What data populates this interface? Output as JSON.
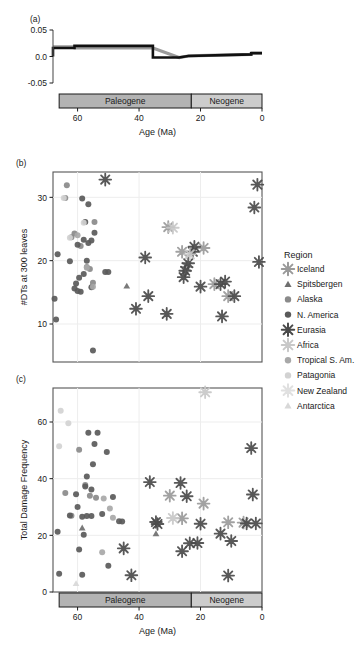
{
  "figure": {
    "panels": [
      "(a)",
      "(b)",
      "(c)"
    ],
    "axis_title_x": "Age (Ma)",
    "eras": [
      {
        "name": "Paleogene",
        "start": 66,
        "end": 23,
        "color": "#b3b3b3"
      },
      {
        "name": "Neogene",
        "start": 23,
        "end": 0,
        "color": "#cccccc"
      }
    ],
    "x_ticks": [
      60,
      40,
      20,
      0
    ],
    "x_range": [
      68,
      0
    ]
  },
  "legend": {
    "title": "Region",
    "items": [
      {
        "label": "Iceland",
        "marker": "asterisk",
        "color": "#9a9a9a"
      },
      {
        "label": "Spitsbergen",
        "marker": "triangle",
        "color": "#6f6f6f"
      },
      {
        "label": "Alaska",
        "marker": "circle",
        "color": "#8a8a8a"
      },
      {
        "label": "N. America",
        "marker": "circle",
        "color": "#5a5a5a"
      },
      {
        "label": "Eurasia",
        "marker": "asterisk",
        "color": "#4a4a4a"
      },
      {
        "label": "Africa",
        "marker": "asterisk",
        "color": "#c8c8c8"
      },
      {
        "label": "Tropical S. Am.",
        "marker": "circle",
        "color": "#a8a8a8"
      },
      {
        "label": "Patagonia",
        "marker": "circle",
        "color": "#d2d2d2"
      },
      {
        "label": "New Zealand",
        "marker": "asterisk",
        "color": "#e0e0e0"
      },
      {
        "label": "Antarctica",
        "marker": "triangle",
        "color": "#d8d8d8"
      }
    ]
  },
  "chart_data": [
    {
      "type": "line",
      "panel": "(a)",
      "title": "",
      "xlabel": "Age (Ma)",
      "ylabel": "",
      "xlim": [
        68,
        0
      ],
      "ylim": [
        -0.05,
        0.05
      ],
      "y_ticks": [
        0.05,
        0.0,
        -0.05
      ],
      "y_tick_labels": [
        "0.05",
        "0.0",
        "-0.05"
      ],
      "x_ticks": [
        60,
        40,
        20,
        0
      ],
      "grid": false,
      "step_line": {
        "name": "rate",
        "color": "#111111",
        "x": [
          68,
          68,
          61,
          61,
          35.5,
          35.5,
          27,
          24,
          3.5,
          3.5,
          0
        ],
        "y": [
          0.0,
          0.016,
          0.016,
          0.02,
          0.02,
          -0.002,
          -0.002,
          0.001,
          0.004,
          0.006,
          0.006
        ]
      },
      "credible_band": {
        "color": "#9b9b9b",
        "x": [
          68,
          61,
          61,
          35.5,
          27,
          24,
          3.5,
          3.5,
          0
        ],
        "y": [
          0.018,
          0.018,
          0.016,
          0.016,
          -0.002,
          0.001,
          0.004,
          0.007,
          0.007
        ]
      }
    },
    {
      "type": "scatter",
      "panel": "(b)",
      "title": "",
      "xlabel": "Age (Ma)",
      "ylabel": "#DTs at 300 leaves",
      "xlim": [
        68,
        0
      ],
      "ylim": [
        4,
        34
      ],
      "y_ticks": [
        10,
        20,
        30
      ],
      "x_ticks": [
        60,
        40,
        20,
        0
      ],
      "grid": true,
      "series": [
        {
          "name": "Iceland",
          "marker": "asterisk",
          "color": "#9a9a9a",
          "points": [
            [
              30.5,
              25.3
            ],
            [
              26.0,
              21.4
            ],
            [
              24.5,
              19.0
            ],
            [
              15.5,
              16.3
            ],
            [
              11.0,
              14.4
            ],
            [
              19.0,
              22.0
            ]
          ]
        },
        {
          "name": "Spitsbergen",
          "marker": "triangle",
          "color": "#6f6f6f",
          "points": [
            [
              44.0,
              16.0
            ]
          ]
        },
        {
          "name": "Alaska",
          "marker": "circle",
          "color": "#8a8a8a",
          "points": [
            [
              63.5,
              31.9
            ],
            [
              64.0,
              29.9
            ],
            [
              62.0,
              23.7
            ],
            [
              61.0,
              24.3
            ],
            [
              59.0,
              22.3
            ],
            [
              54.5,
              26.1
            ],
            [
              57.0,
              19.0
            ],
            [
              56.0,
              18.7
            ],
            [
              55.0,
              16.5
            ]
          ]
        },
        {
          "name": "N. America",
          "marker": "circle",
          "color": "#5a5a5a",
          "points": [
            [
              58.5,
              29.8
            ],
            [
              56.5,
              28.9
            ],
            [
              57.5,
              26.1
            ],
            [
              60.0,
              22.5
            ],
            [
              58.0,
              23.3
            ],
            [
              55.5,
              23.2
            ],
            [
              54.5,
              24.4
            ],
            [
              51.0,
              18.2
            ],
            [
              50.0,
              18.2
            ],
            [
              57.0,
              20.0
            ],
            [
              59.5,
              17.3
            ],
            [
              58.0,
              17.9
            ],
            [
              60.5,
              16.4
            ],
            [
              61.0,
              15.6
            ],
            [
              60.0,
              15.2
            ],
            [
              59.0,
              15.1
            ],
            [
              55.5,
              15.8
            ],
            [
              66.5,
              21.0
            ],
            [
              67.5,
              14.0
            ],
            [
              67.0,
              10.7
            ],
            [
              55.0,
              5.8
            ],
            [
              62.5,
              19.9
            ],
            [
              56.5,
              22.8
            ]
          ]
        },
        {
          "name": "Eurasia",
          "marker": "asterisk",
          "color": "#4a4a4a",
          "points": [
            [
              51.0,
              32.8
            ],
            [
              1.5,
              32.0
            ],
            [
              2.5,
              28.4
            ],
            [
              22.0,
              22.2
            ],
            [
              22.5,
              21.4
            ],
            [
              24.0,
              19.6
            ],
            [
              25.0,
              18.4
            ],
            [
              25.5,
              17.4
            ],
            [
              20.0,
              15.9
            ],
            [
              13.5,
              16.3
            ],
            [
              12.0,
              16.7
            ],
            [
              38.0,
              20.5
            ],
            [
              37.0,
              14.4
            ],
            [
              41.0,
              12.4
            ],
            [
              31.0,
              11.6
            ],
            [
              13.0,
              11.2
            ],
            [
              1.0,
              19.8
            ],
            [
              9.0,
              14.4
            ]
          ]
        },
        {
          "name": "Africa",
          "marker": "asterisk",
          "color": "#c8c8c8",
          "points": [
            [
              29.0,
              25.2
            ],
            [
              23.5,
              21.0
            ]
          ]
        },
        {
          "name": "Tropical S. Am.",
          "marker": "circle",
          "color": "#a8a8a8",
          "points": [
            [
              60.0,
              24.0
            ],
            [
              57.0,
              18.9
            ],
            [
              55.0,
              15.9
            ]
          ]
        },
        {
          "name": "Patagonia",
          "marker": "circle",
          "color": "#d2d2d2",
          "points": [
            [
              64.5,
              29.9
            ],
            [
              62.5,
              23.6
            ],
            [
              58.0,
              26.0
            ]
          ]
        },
        {
          "name": "New Zealand",
          "marker": "asterisk",
          "color": "#e0e0e0",
          "points": []
        },
        {
          "name": "Antarctica",
          "marker": "triangle",
          "color": "#d8d8d8",
          "points": []
        }
      ]
    },
    {
      "type": "scatter",
      "panel": "(c)",
      "title": "",
      "xlabel": "Age (Ma)",
      "ylabel": "Total Damage Frequency",
      "xlim": [
        68,
        0
      ],
      "ylim": [
        0,
        72
      ],
      "y_ticks": [
        0,
        20,
        40,
        60
      ],
      "x_ticks": [
        60,
        40,
        20,
        0
      ],
      "grid": true,
      "series": [
        {
          "name": "Iceland",
          "marker": "asterisk",
          "color": "#9a9a9a",
          "points": [
            [
              19.0,
              31.2
            ],
            [
              26.0,
              26.0
            ],
            [
              11.0,
              24.6
            ],
            [
              30.0,
              34.0
            ],
            [
              6.0,
              24.5
            ]
          ]
        },
        {
          "name": "Spitsbergen",
          "marker": "triangle",
          "color": "#6f6f6f",
          "points": [
            [
              58.5,
              22.6
            ],
            [
              34.5,
              20.6
            ]
          ]
        },
        {
          "name": "Alaska",
          "marker": "circle",
          "color": "#8a8a8a",
          "points": [
            [
              59.5,
              50.2
            ],
            [
              64.0,
              34.9
            ],
            [
              62.0,
              26.9
            ],
            [
              57.5,
              37.8
            ],
            [
              56.0,
              34.0
            ],
            [
              54.0,
              33.3
            ]
          ]
        },
        {
          "name": "N. America",
          "marker": "circle",
          "color": "#5a5a5a",
          "points": [
            [
              56.5,
              56.2
            ],
            [
              53.5,
              56.2
            ],
            [
              54.5,
              52.2
            ],
            [
              50.5,
              49.4
            ],
            [
              55.0,
              45.1
            ],
            [
              57.0,
              40.8
            ],
            [
              57.5,
              37.2
            ],
            [
              55.5,
              36.2
            ],
            [
              48.5,
              33.5
            ],
            [
              60.5,
              34.5
            ],
            [
              62.5,
              27.0
            ],
            [
              57.0,
              26.8
            ],
            [
              55.5,
              26.8
            ],
            [
              58.5,
              26.6
            ],
            [
              46.5,
              25.0
            ],
            [
              45.5,
              24.9
            ],
            [
              66.5,
              21.3
            ],
            [
              58.0,
              20.2
            ],
            [
              59.5,
              15.0
            ],
            [
              50.0,
              9.3
            ],
            [
              66.0,
              6.4
            ],
            [
              58.5,
              6.1
            ],
            [
              52.0,
              27.5
            ],
            [
              60.0,
              30.0
            ]
          ]
        },
        {
          "name": "Eurasia",
          "marker": "asterisk",
          "color": "#4a4a4a",
          "points": [
            [
              3.5,
              50.8
            ],
            [
              26.5,
              38.5
            ],
            [
              36.5,
              38.8
            ],
            [
              24.5,
              33.8
            ],
            [
              3.0,
              34.4
            ],
            [
              34.5,
              24.7
            ],
            [
              34.0,
              24.0
            ],
            [
              20.0,
              24.1
            ],
            [
              5.0,
              24.2
            ],
            [
              2.0,
              24.2
            ],
            [
              45.0,
              15.4
            ],
            [
              23.5,
              17.2
            ],
            [
              21.0,
              17.3
            ],
            [
              10.0,
              18.0
            ],
            [
              13.5,
              20.6
            ],
            [
              26.0,
              14.4
            ],
            [
              42.5,
              5.9
            ],
            [
              11.0,
              5.8
            ]
          ]
        },
        {
          "name": "Africa",
          "marker": "asterisk",
          "color": "#c8c8c8",
          "points": [
            [
              18.5,
              70.5
            ],
            [
              29.0,
              26.1
            ]
          ]
        },
        {
          "name": "Tropical S. Am.",
          "marker": "circle",
          "color": "#a8a8a8",
          "points": [
            [
              51.5,
              33.0
            ],
            [
              49.5,
              29.5
            ],
            [
              48.5,
              26.2
            ],
            [
              52.0,
              14.0
            ]
          ]
        },
        {
          "name": "Patagonia",
          "marker": "circle",
          "color": "#d2d2d2",
          "points": [
            [
              65.5,
              64.0
            ],
            [
              63.0,
              59.6
            ],
            [
              66.0,
              51.4
            ]
          ]
        },
        {
          "name": "New Zealand",
          "marker": "asterisk",
          "color": "#e0e0e0",
          "points": []
        },
        {
          "name": "Antarctica",
          "marker": "triangle",
          "color": "#d8d8d8",
          "points": [
            [
              60.5,
              3.0
            ]
          ]
        }
      ]
    }
  ]
}
